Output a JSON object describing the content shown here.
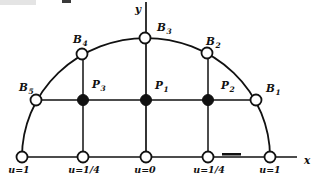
{
  "figure": {
    "width": 319,
    "height": 183,
    "background": "#ffffff",
    "ink_color": "#111111",
    "description_semantics": "semicircular-grid-with-boundary-and-interior-nodes",
    "axes": {
      "y_axis": {
        "label": "y",
        "x": 146,
        "y1": 2,
        "y2": 157,
        "label_x": 135,
        "label_y": 13
      },
      "x_axis": {
        "label": "x",
        "y": 157,
        "x1": 22,
        "x2": 297,
        "label_x": 304,
        "label_y": 164
      }
    },
    "arc": {
      "cx": 146,
      "cy": 157,
      "rx": 124,
      "ry": 119,
      "stroke_width": 1.8
    },
    "grid_lines": [
      {
        "name": "vertical-left",
        "x1": 83,
        "y1": 54,
        "x2": 83,
        "y2": 157
      },
      {
        "name": "vertical-right",
        "x1": 208,
        "y1": 53,
        "x2": 208,
        "y2": 157
      },
      {
        "name": "horizontal-mid",
        "x1": 36,
        "y1": 100,
        "x2": 256,
        "y2": 100
      }
    ],
    "open_nodes": [
      {
        "name": "bottom-node-u1-left",
        "cx": 22,
        "cy": 157
      },
      {
        "name": "bottom-node-u14-left",
        "cx": 83,
        "cy": 157
      },
      {
        "name": "bottom-node-u0",
        "cx": 146,
        "cy": 157
      },
      {
        "name": "bottom-node-u14-right",
        "cx": 208,
        "cy": 157
      },
      {
        "name": "bottom-node-u1-right",
        "cx": 270,
        "cy": 157
      },
      {
        "name": "boundary-node-B5",
        "cx": 36,
        "cy": 100
      },
      {
        "name": "boundary-node-B4",
        "cx": 82,
        "cy": 54
      },
      {
        "name": "boundary-node-B3",
        "cx": 145,
        "cy": 38
      },
      {
        "name": "boundary-node-B2",
        "cx": 207,
        "cy": 53
      },
      {
        "name": "boundary-node-B1",
        "cx": 256,
        "cy": 100
      }
    ],
    "filled_nodes": [
      {
        "name": "interior-node-P3",
        "cx": 83,
        "cy": 100
      },
      {
        "name": "interior-node-P1",
        "cx": 146,
        "cy": 100
      },
      {
        "name": "interior-node-P2",
        "cx": 208,
        "cy": 100
      }
    ],
    "node_radius": 5.5,
    "node_labels": [
      {
        "name": "label-B5",
        "base": "B",
        "sub": "5",
        "x": 19,
        "y": 91
      },
      {
        "name": "label-B4",
        "base": "B",
        "sub": "4",
        "x": 73,
        "y": 43
      },
      {
        "name": "label-B3",
        "base": "B",
        "sub": "3",
        "x": 157,
        "y": 31
      },
      {
        "name": "label-B2",
        "base": "B",
        "sub": "2",
        "x": 206,
        "y": 45
      },
      {
        "name": "label-B1",
        "base": "B",
        "sub": "1",
        "x": 266,
        "y": 92
      },
      {
        "name": "label-P3",
        "base": "P",
        "sub": "3",
        "x": 92,
        "y": 88
      },
      {
        "name": "label-P1",
        "base": "P",
        "sub": "1",
        "x": 155,
        "y": 89
      },
      {
        "name": "label-P2",
        "base": "P",
        "sub": "2",
        "x": 221,
        "y": 89
      }
    ],
    "boundary_value_labels": [
      {
        "name": "value-u1-left",
        "text": "u=1",
        "x": 19,
        "y": 173
      },
      {
        "name": "value-u14-left",
        "text": "u=1/4",
        "x": 84,
        "y": 173
      },
      {
        "name": "value-u0",
        "text": "u=0",
        "x": 145,
        "y": 173
      },
      {
        "name": "value-u14-right",
        "text": "u=1/4",
        "x": 209,
        "y": 173
      },
      {
        "name": "value-u1-right",
        "text": "u=1",
        "x": 270,
        "y": 173
      }
    ],
    "print_marks": [
      {
        "name": "scan-smudge-top",
        "x": 62,
        "y": 0,
        "w": 9,
        "h": 3,
        "color": "#3a3a3a"
      },
      {
        "name": "scan-faint-bar-top",
        "x": 0,
        "y": 0,
        "w": 36,
        "h": 5,
        "color": "#e4e4e4"
      },
      {
        "name": "axis-dash-mark",
        "x": 222,
        "y": 153,
        "w": 19,
        "h": 2.5,
        "color": "#111111"
      }
    ]
  }
}
